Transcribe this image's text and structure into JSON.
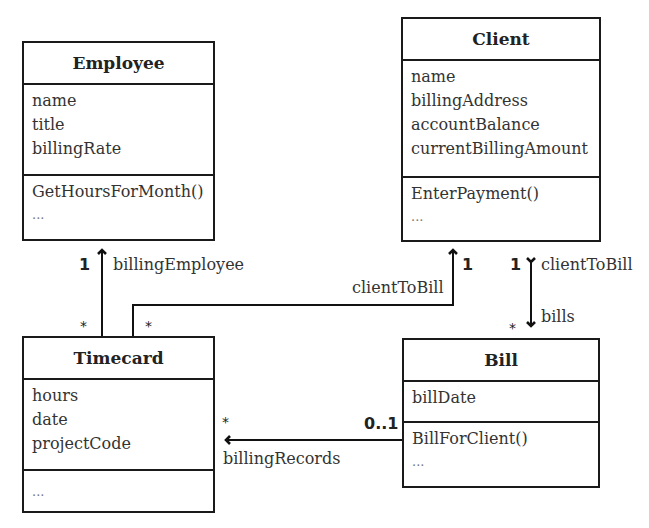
{
  "classes": {
    "employee": {
      "name": "Employee",
      "attributes": [
        "name",
        "title",
        "billingRate"
      ],
      "operations": [
        "GetHoursForMonth()",
        "..."
      ]
    },
    "client": {
      "name": "Client",
      "attributes": [
        "name",
        "billingAddress",
        "accountBalance",
        "currentBillingAmount"
      ],
      "operations": [
        "EnterPayment()",
        "..."
      ]
    },
    "timecard": {
      "name": "Timecard",
      "attributes": [
        "hours",
        "date",
        "projectCode"
      ],
      "operations": [
        "..."
      ]
    },
    "bill": {
      "name": "Bill",
      "attributes": [
        "billDate"
      ],
      "operations": [
        "BillForClient()",
        "..."
      ]
    }
  },
  "associations": {
    "timecard_employee": {
      "role": "billingEmployee",
      "target_mult": "1",
      "source_mult": "*"
    },
    "timecard_client": {
      "role": "clientToBill",
      "target_mult": "1",
      "source_mult": "*"
    },
    "client_bill": {
      "role_client": "clientToBill",
      "role_bill": "bills",
      "client_mult": "1",
      "bill_mult": "*"
    },
    "bill_timecard": {
      "role": "billingRecords",
      "target_mult": "*",
      "source_mult": "0..1"
    }
  }
}
